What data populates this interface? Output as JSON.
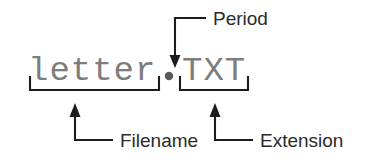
{
  "diagram": {
    "colors": {
      "background": "#ffffff",
      "filename_text": "#7d7d7d",
      "label_text": "#2b2b2b",
      "line": "#1c1c1c",
      "period_dot": "#5a5a5a"
    },
    "filename_string": {
      "base": "letter",
      "separator": ".",
      "extension": "TXT",
      "full": "letter.TXT"
    },
    "callouts": [
      {
        "id": "period",
        "label": "Period",
        "points_to": ".",
        "direction": "down"
      },
      {
        "id": "filename",
        "label": "Filename",
        "points_to": "letter",
        "direction": "up"
      },
      {
        "id": "extension",
        "label": "Extension",
        "points_to": "TXT",
        "direction": "up"
      }
    ]
  }
}
